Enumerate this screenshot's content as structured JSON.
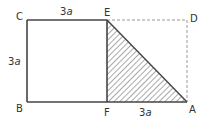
{
  "diagram": {
    "type": "geometry",
    "colors": {
      "line": "#444444",
      "dashed": "#999999",
      "hatch": "#555555",
      "text": "#333333",
      "background": "#ffffff"
    },
    "points": {
      "A": {
        "label": "A",
        "x": 187,
        "y": 102
      },
      "B": {
        "label": "B",
        "x": 27,
        "y": 102
      },
      "C": {
        "label": "C",
        "x": 27,
        "y": 20
      },
      "D": {
        "label": "D",
        "x": 187,
        "y": 20
      },
      "E": {
        "label": "E",
        "x": 107,
        "y": 20
      },
      "F": {
        "label": "F",
        "x": 107,
        "y": 102
      }
    },
    "labels": {
      "point_A": "A",
      "point_B": "B",
      "point_C": "C",
      "point_D": "D",
      "point_E": "E",
      "point_F": "F"
    },
    "dimensions": {
      "top_CE": {
        "coef": "3",
        "var": "a"
      },
      "left_CB": {
        "coef": "3",
        "var": "a"
      },
      "bottom_FA": {
        "coef": "3",
        "var": "a"
      }
    },
    "segments": {
      "solid": [
        "C-E",
        "C-B",
        "B-F",
        "E-F",
        "F-A",
        "E-A"
      ],
      "dashed": [
        "E-D",
        "D-A"
      ]
    },
    "shaded_region": "triangle E-F-A"
  }
}
